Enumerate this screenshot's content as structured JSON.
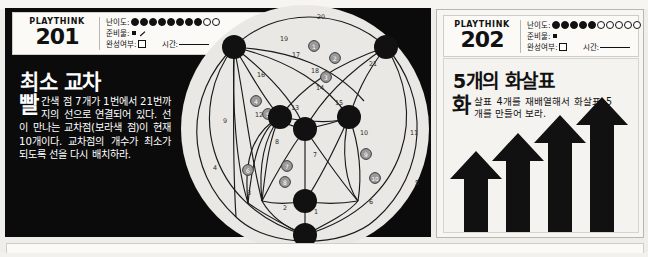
{
  "page": {
    "background_color": "#efeeea",
    "panel_dark_color": "#0b0b0b",
    "accent_color": "#111111"
  },
  "puzzle_201": {
    "brand": "PLAYTHINK",
    "number": "201",
    "difficulty": {
      "label": "난이도:",
      "filled": 8,
      "empty": 2
    },
    "materials": {
      "label": "준비물:",
      "icons": [
        "square-icon",
        "pencil-icon"
      ]
    },
    "completed": {
      "label": "완성여부:",
      "checkbox": "□"
    },
    "time": {
      "label": "시간:"
    },
    "title": "최소 교차",
    "dropcap": "빨",
    "body": "간색 점 7개가 1번에서 21번까지의 선으로 연결되어 있다. 선이 만나는 교차점(보라색 점)이 현재 10개이다. 교차점의 개수가 최소가 되도록 선을 다시 배치하라.",
    "diagram": {
      "name": "minimum-crossings-graph",
      "node_count": 7,
      "edge_count": 21,
      "crossing_count": 10,
      "crossing_labels": [
        "1",
        "2",
        "3",
        "4",
        "5",
        "6",
        "7",
        "8",
        "9",
        "10"
      ],
      "edge_labels": [
        "1",
        "2",
        "3",
        "4",
        "5",
        "6",
        "7",
        "8",
        "9",
        "10",
        "11",
        "12",
        "13",
        "14",
        "15",
        "16",
        "17",
        "18",
        "19",
        "20",
        "21"
      ]
    }
  },
  "puzzle_202": {
    "brand": "PLAYTHINK",
    "number": "202",
    "difficulty": {
      "label": "난이도:",
      "filled": 5,
      "empty": 5
    },
    "materials": {
      "label": "준비물:",
      "icons": [
        "square-icon"
      ]
    },
    "completed": {
      "label": "완성여부:",
      "checkbox": "□"
    },
    "time": {
      "label": "시간:"
    },
    "title": "5개의 화살표",
    "dropcap": "화",
    "body": "살표 4개를 재배열해서 화살표 5개를 만들어 보라.",
    "illustration": {
      "name": "four-arrows",
      "arrow_count": 4,
      "direction": "up"
    }
  }
}
